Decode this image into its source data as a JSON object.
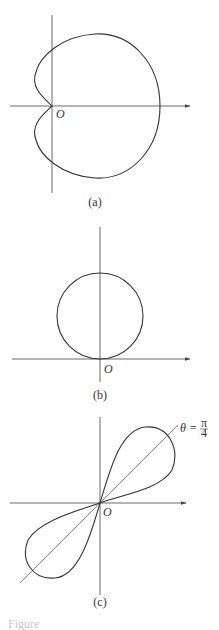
{
  "figure": {
    "panels": [
      {
        "id": "a",
        "caption": "(a)",
        "origin_label": "O",
        "curve": "cardioid"
      },
      {
        "id": "b",
        "caption": "(b)",
        "origin_label": "O",
        "curve": "circle"
      },
      {
        "id": "c",
        "caption": "(c)",
        "origin_label": "O",
        "curve": "lemniscate",
        "annotation": "θ = π/4",
        "annotation_theta": "θ =",
        "annotation_frac_num": "π",
        "annotation_frac_den": "4"
      }
    ],
    "footer_text": "Figure"
  },
  "colors": {
    "stroke": "#333333",
    "axis": "#444444",
    "background": "#ffffff"
  }
}
